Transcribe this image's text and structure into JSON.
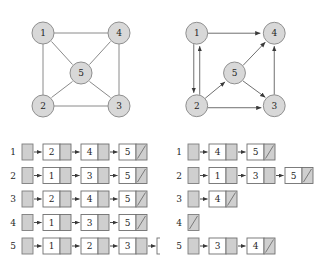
{
  "figure": {
    "colors": {
      "node_fill": "#d8d8d8",
      "node_stroke": "#8f8f8f",
      "edge": "#8a8a8a",
      "array_cell_fill": "#cfcfcf",
      "value_cell_fill": "#ffffff",
      "pointer_cell_fill": "#cfcfcf",
      "cell_stroke": "#6f6f6f",
      "link_arrow": "#3a3a3a",
      "background": "#ffffff",
      "text": "#1f1f1f"
    }
  },
  "graphs": [
    {
      "id": "undirected-graph",
      "kind": "undirected",
      "vertices": [
        {
          "id": "1",
          "label": "1",
          "x": 43,
          "y": 33
        },
        {
          "id": "2",
          "label": "2",
          "x": 43,
          "y": 106
        },
        {
          "id": "3",
          "label": "3",
          "x": 119,
          "y": 106
        },
        {
          "id": "4",
          "label": "4",
          "x": 119,
          "y": 33
        },
        {
          "id": "5",
          "label": "5",
          "x": 81,
          "y": 73
        }
      ],
      "edges": [
        {
          "from": "1",
          "to": "4"
        },
        {
          "from": "1",
          "to": "2"
        },
        {
          "from": "2",
          "to": "3"
        },
        {
          "from": "3",
          "to": "4"
        },
        {
          "from": "1",
          "to": "5"
        },
        {
          "from": "2",
          "to": "5"
        },
        {
          "from": "3",
          "to": "5"
        },
        {
          "from": "4",
          "to": "5"
        }
      ]
    },
    {
      "id": "directed-graph",
      "kind": "directed",
      "vertices": [
        {
          "id": "1",
          "label": "1",
          "x": 40,
          "y": 33
        },
        {
          "id": "2",
          "label": "2",
          "x": 40,
          "y": 106
        },
        {
          "id": "3",
          "label": "3",
          "x": 118,
          "y": 106
        },
        {
          "id": "4",
          "label": "4",
          "x": 118,
          "y": 33
        },
        {
          "id": "5",
          "label": "5",
          "x": 78,
          "y": 73
        }
      ],
      "edges": [
        {
          "from": "1",
          "to": "4"
        },
        {
          "from": "1",
          "to": "2"
        },
        {
          "from": "2",
          "to": "1"
        },
        {
          "from": "2",
          "to": "5"
        },
        {
          "from": "2",
          "to": "3"
        },
        {
          "from": "5",
          "to": "4"
        },
        {
          "from": "5",
          "to": "3"
        },
        {
          "from": "3",
          "to": "4"
        }
      ]
    }
  ],
  "adjacency_lists": [
    {
      "id": "undirected-adjacency-list",
      "for_graph": "undirected-graph",
      "rows": [
        {
          "index": "1",
          "items": [
            "2",
            "4",
            "5"
          ]
        },
        {
          "index": "2",
          "items": [
            "1",
            "3",
            "5"
          ]
        },
        {
          "index": "3",
          "items": [
            "2",
            "4",
            "5"
          ]
        },
        {
          "index": "4",
          "items": [
            "1",
            "3",
            "5"
          ]
        },
        {
          "index": "5",
          "items": [
            "1",
            "2",
            "3",
            "4"
          ]
        }
      ]
    },
    {
      "id": "directed-adjacency-list",
      "for_graph": "directed-graph",
      "rows": [
        {
          "index": "1",
          "items": [
            "4",
            "5"
          ]
        },
        {
          "index": "2",
          "items": [
            "1",
            "3",
            "5"
          ]
        },
        {
          "index": "3",
          "items": [
            "4"
          ]
        },
        {
          "index": "4",
          "items": []
        },
        {
          "index": "5",
          "items": [
            "3",
            "4"
          ]
        }
      ]
    }
  ]
}
